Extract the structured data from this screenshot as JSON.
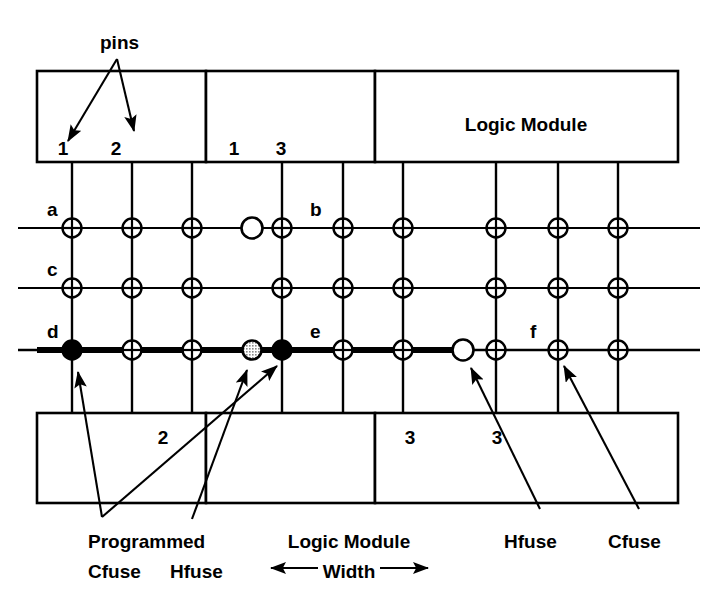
{
  "figure": {
    "stroke_color": "#000000",
    "background_color": "#ffffff",
    "fuse_fill_open": "#ffffff",
    "fuse_fill_programmed": "#000000",
    "fuse_fill_partial": "#9a9a9a"
  },
  "callouts": {
    "pins": "pins",
    "programmed": "Programmed",
    "cfuse_left": "Cfuse",
    "hfuse_left": "Hfuse",
    "logic_module_width_line1": "Logic Module",
    "logic_module_width_line2": "Width",
    "hfuse_right": "Hfuse",
    "cfuse_right": "Cfuse",
    "arrow_left_glyph": "←",
    "arrow_right_glyph": "→"
  },
  "top_modules": [
    {
      "name": "top-module-1",
      "x": 37,
      "width": 169,
      "pins": [
        {
          "label": "1",
          "x": 63
        },
        {
          "label": "2",
          "x": 116
        }
      ],
      "title": ""
    },
    {
      "name": "top-module-2",
      "x": 206,
      "width": 169,
      "pins": [
        {
          "label": "1",
          "x": 234
        },
        {
          "label": "3",
          "x": 281
        }
      ],
      "title": ""
    },
    {
      "name": "top-module-3",
      "x": 375,
      "width": 303,
      "pins": [],
      "title": "Logic Module"
    }
  ],
  "bottom_modules": [
    {
      "name": "bottom-module-1",
      "x": 37,
      "width": 169,
      "pins": [
        {
          "label": "2",
          "x": 163
        }
      ]
    },
    {
      "name": "bottom-module-2",
      "x": 206,
      "width": 169,
      "pins": [
        {
          "label": "3",
          "x": 410
        }
      ]
    },
    {
      "name": "bottom-module-3",
      "x": 375,
      "width": 303,
      "pins": [
        {
          "label": "3",
          "x": 497
        }
      ]
    }
  ],
  "bottom_pin_labels": [
    {
      "label": "2",
      "x": 163
    },
    {
      "label": "3",
      "x": 410
    },
    {
      "label": "3",
      "x": 497
    }
  ],
  "tracks": [
    {
      "id": "a",
      "label": "a",
      "y": 228,
      "bold": false,
      "label_x": 47,
      "label_y": 216
    },
    {
      "id": "c",
      "label": "c",
      "y": 288,
      "bold": false,
      "label_x": 47,
      "label_y": 276
    },
    {
      "id": "d",
      "label": "d",
      "y": 350,
      "bold": true,
      "label_x": 47,
      "label_y": 338
    }
  ],
  "track_segment_labels": [
    {
      "label": "b",
      "x": 310,
      "y": 216
    },
    {
      "label": "e",
      "x": 310,
      "y": 338
    },
    {
      "label": "f",
      "x": 530,
      "y": 338
    }
  ],
  "vertical_lines_x": [
    72,
    132,
    192,
    282,
    343,
    403,
    496,
    558,
    618
  ],
  "crossings": [
    {
      "track": "a",
      "x": 72,
      "type": "open-cross"
    },
    {
      "track": "a",
      "x": 132,
      "type": "open-cross"
    },
    {
      "track": "a",
      "x": 192,
      "type": "open-cross"
    },
    {
      "track": "a",
      "x": 252,
      "type": "hfuse-open"
    },
    {
      "track": "a",
      "x": 282,
      "type": "open-cross"
    },
    {
      "track": "a",
      "x": 343,
      "type": "open-cross"
    },
    {
      "track": "a",
      "x": 403,
      "type": "open-cross"
    },
    {
      "track": "a",
      "x": 496,
      "type": "open-cross"
    },
    {
      "track": "a",
      "x": 558,
      "type": "open-cross"
    },
    {
      "track": "a",
      "x": 618,
      "type": "open-cross"
    },
    {
      "track": "c",
      "x": 72,
      "type": "open-cross"
    },
    {
      "track": "c",
      "x": 132,
      "type": "open-cross"
    },
    {
      "track": "c",
      "x": 192,
      "type": "open-cross"
    },
    {
      "track": "c",
      "x": 282,
      "type": "open-cross"
    },
    {
      "track": "c",
      "x": 343,
      "type": "open-cross"
    },
    {
      "track": "c",
      "x": 403,
      "type": "open-cross"
    },
    {
      "track": "c",
      "x": 496,
      "type": "open-cross"
    },
    {
      "track": "c",
      "x": 558,
      "type": "open-cross"
    },
    {
      "track": "c",
      "x": 618,
      "type": "open-cross"
    },
    {
      "track": "d",
      "x": 72,
      "type": "programmed-cfuse"
    },
    {
      "track": "d",
      "x": 132,
      "type": "open-cross"
    },
    {
      "track": "d",
      "x": 192,
      "type": "open-cross"
    },
    {
      "track": "d",
      "x": 252,
      "type": "programmed-hfuse"
    },
    {
      "track": "d",
      "x": 282,
      "type": "programmed-cfuse"
    },
    {
      "track": "d",
      "x": 343,
      "type": "open-cross"
    },
    {
      "track": "d",
      "x": 403,
      "type": "open-cross"
    },
    {
      "track": "d",
      "x": 463,
      "type": "hfuse-open"
    },
    {
      "track": "d",
      "x": 496,
      "type": "open-cross"
    },
    {
      "track": "d",
      "x": 558,
      "type": "open-cross"
    },
    {
      "track": "d",
      "x": 618,
      "type": "open-cross"
    }
  ],
  "bold_segments": [
    {
      "track": "d",
      "x1": 37,
      "x2": 463
    }
  ]
}
